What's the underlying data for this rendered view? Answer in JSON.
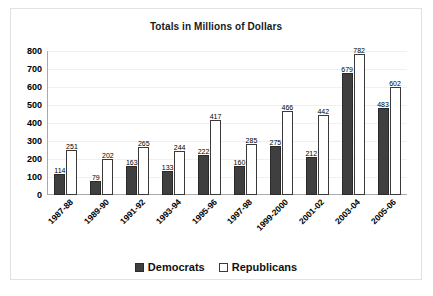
{
  "chart_data": {
    "type": "bar",
    "title": "Totals in Millions of Dollars",
    "xlabel": "",
    "ylabel": "",
    "ylim": [
      0,
      800
    ],
    "yticks": [
      800,
      700,
      600,
      500,
      400,
      300,
      200,
      100,
      0
    ],
    "grid": true,
    "legend_position": "bottom",
    "categories": [
      "1987-88",
      "1989-90",
      "1991-92",
      "1993-94",
      "1995-96",
      "1997-98",
      "1999-2000",
      "2001-02",
      "2003-04",
      "2005-06"
    ],
    "series": [
      {
        "name": "Democrats",
        "color": "#3f3f3f",
        "values": [
          114,
          79,
          163,
          133,
          222,
          160,
          275,
          212,
          679,
          483
        ]
      },
      {
        "name": "Republicans",
        "color": "#ffffff",
        "values": [
          251,
          202,
          265,
          244,
          417,
          285,
          466,
          442,
          782,
          602
        ]
      }
    ]
  },
  "legend": {
    "items": [
      {
        "label": "Democrats",
        "swatch": "filled-dark-square-icon"
      },
      {
        "label": "Republicans",
        "swatch": "outlined-white-square-icon"
      }
    ]
  }
}
